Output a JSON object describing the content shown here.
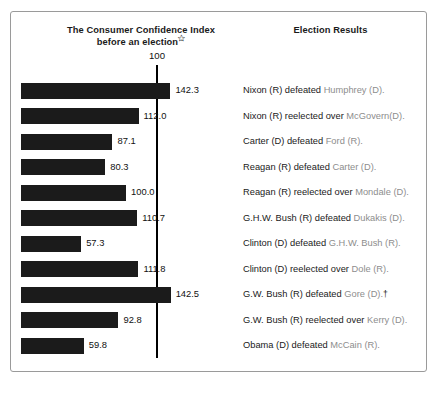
{
  "figure": {
    "chart_column_header_line1": "The Consumer Confidence Index",
    "chart_column_header_line2": "before an election",
    "footnote_marker": "✩",
    "results_column_header": "Election Results",
    "reference_label": "100"
  },
  "chart_data": {
    "type": "bar",
    "orientation": "horizontal",
    "title": "The Consumer Confidence Index before an election",
    "xlabel": "",
    "ylabel": "",
    "categories": [
      "1968",
      "1972",
      "1976",
      "1980",
      "1984",
      "1988",
      "1992",
      "1996",
      "2000",
      "2004",
      "2008"
    ],
    "values": [
      142.3,
      112.0,
      87.1,
      80.3,
      100.0,
      110.7,
      57.3,
      111.8,
      142.5,
      92.8,
      59.8
    ],
    "value_labels": [
      "142.3",
      "112.0",
      "87.1",
      "80.3",
      "100.0",
      "110.7",
      "57.3",
      "111.8",
      "142.5",
      "92.8",
      "59.8"
    ],
    "reference_line": 100,
    "xlim": [
      0,
      150
    ],
    "grid": false,
    "legend": false,
    "bar_color": "#1b1b1b",
    "reference_line_color": "#000000"
  },
  "rows": [
    {
      "year": "1968",
      "value": 142.3,
      "value_label": "142.3",
      "winner": "Nixon (R)",
      "verb": " defeated ",
      "loser": "Humphrey (D).",
      "dagger": ""
    },
    {
      "year": "1972",
      "value": 112.0,
      "value_label": "112.0",
      "winner": "Nixon (R)",
      "verb": " reelected over ",
      "loser": "McGovern(D).",
      "dagger": ""
    },
    {
      "year": "1976",
      "value": 87.1,
      "value_label": "87.1",
      "winner": "Carter (D)",
      "verb": " defeated ",
      "loser": "Ford (R).",
      "dagger": ""
    },
    {
      "year": "1980",
      "value": 80.3,
      "value_label": "80.3",
      "winner": "Reagan (R)",
      "verb": " defeated ",
      "loser": "Carter (D).",
      "dagger": ""
    },
    {
      "year": "1984",
      "value": 100.0,
      "value_label": "100.0",
      "winner": "Reagan (R)",
      "verb": " reelected over ",
      "loser": "Mondale (D).",
      "dagger": ""
    },
    {
      "year": "1988",
      "value": 110.7,
      "value_label": "110.7",
      "winner": "G.H.W. Bush (R)",
      "verb": " defeated ",
      "loser": "Dukakis (D).",
      "dagger": ""
    },
    {
      "year": "1992",
      "value": 57.3,
      "value_label": "57.3",
      "winner": "Clinton (D)",
      "verb": " defeated ",
      "loser": "G.H.W. Bush (R).",
      "dagger": ""
    },
    {
      "year": "1996",
      "value": 111.8,
      "value_label": "111.8",
      "winner": "Clinton (D)",
      "verb": " reelected over ",
      "loser": "Dole (R).",
      "dagger": ""
    },
    {
      "year": "2000",
      "value": 142.5,
      "value_label": "142.5",
      "winner": "G.W. Bush (R)",
      "verb": " defeated ",
      "loser": "Gore (D).",
      "dagger": "†"
    },
    {
      "year": "2004",
      "value": 92.8,
      "value_label": "92.8",
      "winner": "G.W. Bush (R)",
      "verb": " reelected over ",
      "loser": "Kerry (D).",
      "dagger": ""
    },
    {
      "year": "2008",
      "value": 59.8,
      "value_label": "59.8",
      "winner": "Obama (D)",
      "verb": " defeated ",
      "loser": "McCain (R).",
      "dagger": ""
    }
  ],
  "layout": {
    "bar_origin_x": 10,
    "px_per_unit": 1.05,
    "first_row_top": 66,
    "row_step": 25.5
  }
}
